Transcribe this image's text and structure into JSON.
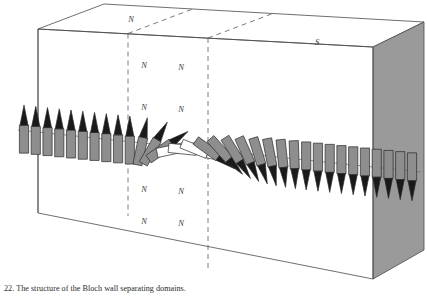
{
  "figure": {
    "title_label": "Bloch wall structure diagram",
    "caption_number": "22.",
    "caption_text": "The structure of the Bloch wall separating domains.",
    "background_color": "#ffffff",
    "line_color": "#4a4a4a",
    "dash_color": "#5a5a5a",
    "arrow_body_color": "#8e8e8e",
    "arrow_head_color": "#1a1a1a",
    "arrow_outline_color": "#2a2a2a",
    "face_shade_color": "#9a9a9a",
    "top_face_color": "#ffffff"
  },
  "box": {
    "name": "magnetic-domain-block",
    "front_top_left": [
      38,
      29
    ],
    "front_top_right": [
      373,
      47
    ],
    "front_bottom_left": [
      38,
      213
    ],
    "front_bottom_right": [
      373,
      279
    ],
    "back_top_left": [
      104,
      4
    ],
    "back_top_right": [
      424,
      22
    ],
    "back_bottom_right": [
      424,
      250
    ]
  },
  "labels": {
    "top_face": [
      {
        "text": "N",
        "x": 131,
        "y": 22,
        "name": "top-face-label-n"
      },
      {
        "text": "S",
        "x": 317,
        "y": 45,
        "name": "top-face-label-s"
      }
    ],
    "interior": [
      {
        "text": "N",
        "x": 144,
        "y": 68,
        "name": "interior-label-n-1"
      },
      {
        "text": "N",
        "x": 181,
        "y": 70,
        "name": "interior-label-n-2"
      },
      {
        "text": "N",
        "x": 144,
        "y": 110,
        "name": "interior-label-n-3"
      },
      {
        "text": "N",
        "x": 181,
        "y": 112,
        "name": "interior-label-n-4"
      },
      {
        "text": "N",
        "x": 144,
        "y": 192,
        "name": "interior-label-n-5"
      },
      {
        "text": "N",
        "x": 181,
        "y": 194,
        "name": "interior-label-n-6"
      },
      {
        "text": "N",
        "x": 144,
        "y": 224,
        "name": "interior-label-n-7"
      },
      {
        "text": "N",
        "x": 181,
        "y": 226,
        "name": "interior-label-n-8"
      }
    ]
  },
  "dashed_walls": [
    {
      "name": "wall-boundary-left",
      "x_front": 128,
      "y_top": 34,
      "y_bottom": 217,
      "x_back": 194,
      "y_back_top": 9
    },
    {
      "name": "wall-boundary-right",
      "x_front": 208,
      "y_top": 38,
      "y_bottom": 231,
      "x_back": 274,
      "y_back_top": 13
    }
  ],
  "guide_line": {
    "name": "spin-axis-guide",
    "x1": 18,
    "y1": 130,
    "x2": 420,
    "y2": 172
  },
  "chart_data": {
    "type": "vector-field",
    "xlabel": "position across wall",
    "ylabel": "spin direction",
    "angle_units": "degrees, 0 = up, 180 = down",
    "arrow_count": 34,
    "angles": [
      0,
      0,
      0,
      0,
      0,
      0,
      0,
      0,
      0,
      0,
      12,
      30,
      55,
      78,
      96,
      112,
      126,
      138,
      148,
      156,
      163,
      169,
      174,
      178,
      180,
      180,
      180,
      180,
      180,
      180,
      180,
      180,
      180,
      180
    ],
    "domains": [
      {
        "name": "left-domain",
        "label": "N",
        "spin": "up",
        "arrow_index_start": 0,
        "arrow_index_end": 9
      },
      {
        "name": "bloch-wall",
        "label": "transition",
        "spin": "rotating",
        "arrow_index_start": 10,
        "arrow_index_end": 23
      },
      {
        "name": "right-domain",
        "label": "S",
        "spin": "down",
        "arrow_index_start": 24,
        "arrow_index_end": 33
      }
    ]
  }
}
